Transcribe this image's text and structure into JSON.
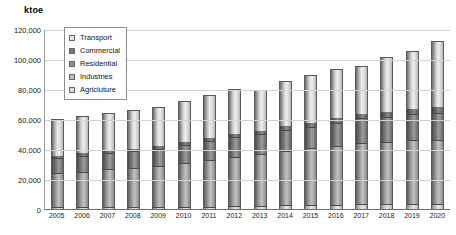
{
  "axis_title": "ktoe",
  "legend": {
    "items": [
      {
        "label": "Transport",
        "swatch": "transport-swatch"
      },
      {
        "label": "Commercial",
        "swatch": "commercial-swatch"
      },
      {
        "label": "Residential",
        "swatch": "residential-swatch"
      },
      {
        "label": "Industries",
        "swatch": "industries-swatch"
      },
      {
        "label": "Agricluture",
        "swatch": "agriculture-swatch"
      }
    ]
  },
  "yticks": [
    "120,000",
    "100,000",
    "80,000",
    "60,000",
    "40,000",
    "20,000",
    "0"
  ],
  "chart_data": {
    "type": "bar",
    "title": "",
    "subtitle": "",
    "xlabel": "",
    "ylabel": "ktoe",
    "ylim": [
      0,
      120000
    ],
    "ytick_values": [
      0,
      20000,
      40000,
      60000,
      80000,
      100000,
      120000
    ],
    "grid": true,
    "stacked": true,
    "legend_position": "top-left-inside",
    "categories": [
      "2005",
      "2006",
      "2007",
      "2008",
      "2009",
      "2010",
      "2011",
      "2012",
      "2013",
      "2014",
      "2015",
      "2016",
      "2017",
      "2018",
      "2019",
      "2020"
    ],
    "series": [
      {
        "name": "Agricluture",
        "color": "#dcdcdc",
        "values": [
          1200,
          1250,
          1300,
          1350,
          1400,
          1500,
          1600,
          1700,
          1800,
          2600,
          2700,
          2900,
          3300,
          3400,
          3500,
          3600
        ]
      },
      {
        "name": "Industries",
        "color": "#bdbdbd",
        "values": [
          23000,
          24000,
          25500,
          26500,
          27500,
          29500,
          31500,
          33500,
          35000,
          36500,
          38000,
          39500,
          41000,
          41500,
          42500,
          43000
        ]
      },
      {
        "name": "Residential",
        "color": "#8f8f8f",
        "values": [
          10500,
          10800,
          11000,
          11200,
          11500,
          12000,
          12500,
          13000,
          13500,
          14000,
          14500,
          15500,
          16500,
          17000,
          17500,
          18000
        ]
      },
      {
        "name": "Commercial",
        "color": "#777777",
        "values": [
          2000,
          2100,
          2200,
          2300,
          2400,
          2500,
          2700,
          2900,
          3000,
          3200,
          3400,
          3600,
          3800,
          4000,
          4200,
          4400
        ]
      },
      {
        "name": "Transport",
        "color": "#e3e3e3",
        "values": [
          24300,
          24850,
          25000,
          25650,
          26200,
          27500,
          28700,
          29900,
          26700,
          29700,
          31400,
          32500,
          31400,
          36100,
          38300,
          44000
        ]
      }
    ],
    "totals": [
      61000,
      63000,
      65000,
      67000,
      69000,
      73000,
      77000,
      81000,
      80000,
      86000,
      90000,
      94000,
      96000,
      102000,
      106000,
      113000
    ]
  }
}
